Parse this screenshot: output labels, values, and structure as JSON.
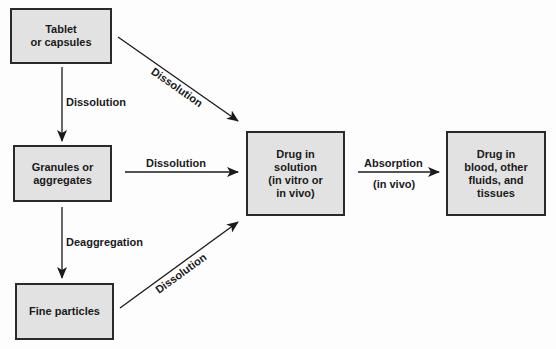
{
  "diagram": {
    "nodes": {
      "tablet": {
        "label": "Tablet\nor capsules"
      },
      "granules": {
        "label": "Granules or\naggregates"
      },
      "fine": {
        "label": "Fine particles"
      },
      "solution": {
        "label": "Drug in\nsolution\n(in vitro or\nin vivo)"
      },
      "blood": {
        "label": "Drug in\nblood, other\nfluids, and\ntissues"
      }
    },
    "edges": {
      "tablet_to_granules": {
        "label": "Dissolution"
      },
      "tablet_to_solution": {
        "label": "Dissolution"
      },
      "granules_to_solution": {
        "label": "Dissolution"
      },
      "granules_to_fine": {
        "label": "Deaggregation"
      },
      "fine_to_solution": {
        "label": "Dissolution"
      },
      "solution_to_blood": {
        "label": "Absorption",
        "sublabel": "(in vivo)"
      }
    },
    "colors": {
      "box_fill": "#e2e2e2",
      "box_border": "#2a2a2a",
      "line": "#1a1a1a"
    }
  }
}
